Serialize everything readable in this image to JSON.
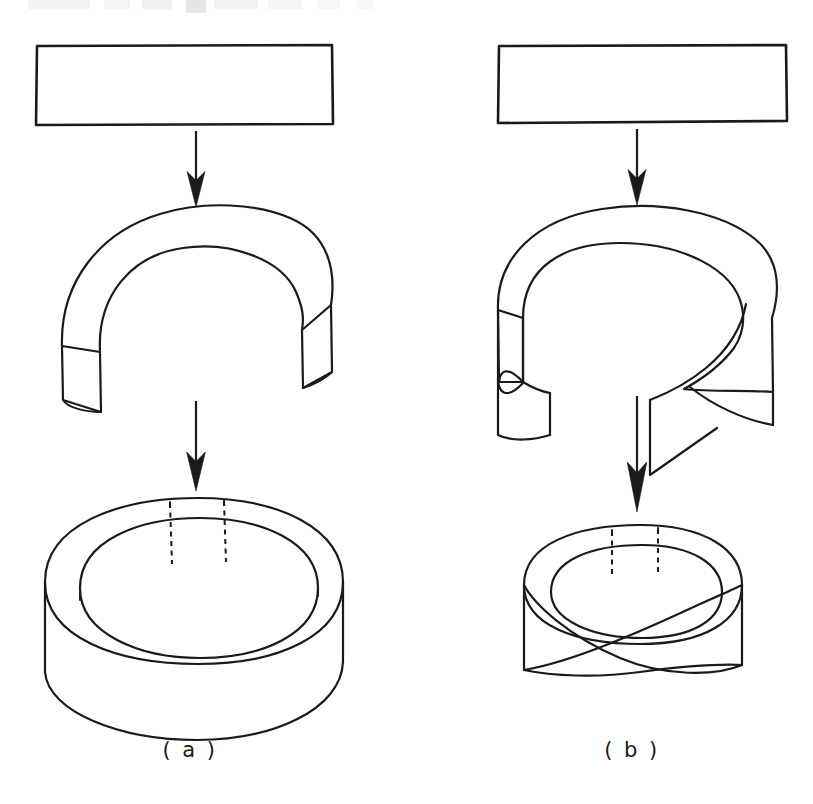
{
  "figure": {
    "kind": "line-diagram",
    "background_color": "#ffffff",
    "ink_color": "#1a1a1a",
    "columns": [
      {
        "id": "column-a",
        "caption": "( a )",
        "caption_position": {
          "x": 190,
          "y": 757
        },
        "stages": [
          {
            "id": "strip",
            "name": "rectangular-strip",
            "label": ""
          },
          {
            "id": "bent-open-band",
            "name": "open-band-untwisted",
            "label": ""
          },
          {
            "id": "closed-cylinder",
            "name": "cylinder",
            "label": ""
          }
        ],
        "arrows": [
          {
            "id": "arrow-a-1",
            "from": "strip",
            "to": "bent-open-band",
            "direction": "down"
          },
          {
            "id": "arrow-a-2",
            "from": "bent-open-band",
            "to": "closed-cylinder",
            "direction": "down"
          }
        ]
      },
      {
        "id": "column-b",
        "caption": "( b )",
        "caption_position": {
          "x": 632,
          "y": 757
        },
        "stages": [
          {
            "id": "strip",
            "name": "rectangular-strip",
            "label": ""
          },
          {
            "id": "bent-twisted-band",
            "name": "open-band-half-twisted",
            "label": ""
          },
          {
            "id": "moebius-band",
            "name": "moebius-band",
            "label": ""
          }
        ],
        "arrows": [
          {
            "id": "arrow-b-1",
            "from": "strip",
            "to": "bent-twisted-band",
            "direction": "down"
          },
          {
            "id": "arrow-b-2",
            "from": "bent-twisted-band",
            "to": "moebius-band",
            "direction": "down"
          }
        ]
      }
    ],
    "captions": {
      "a": "( a )",
      "b": "( b )"
    },
    "scan_artifact": {
      "present": true,
      "note": "faint cut-off text remnants along top edge of scanned page"
    }
  }
}
